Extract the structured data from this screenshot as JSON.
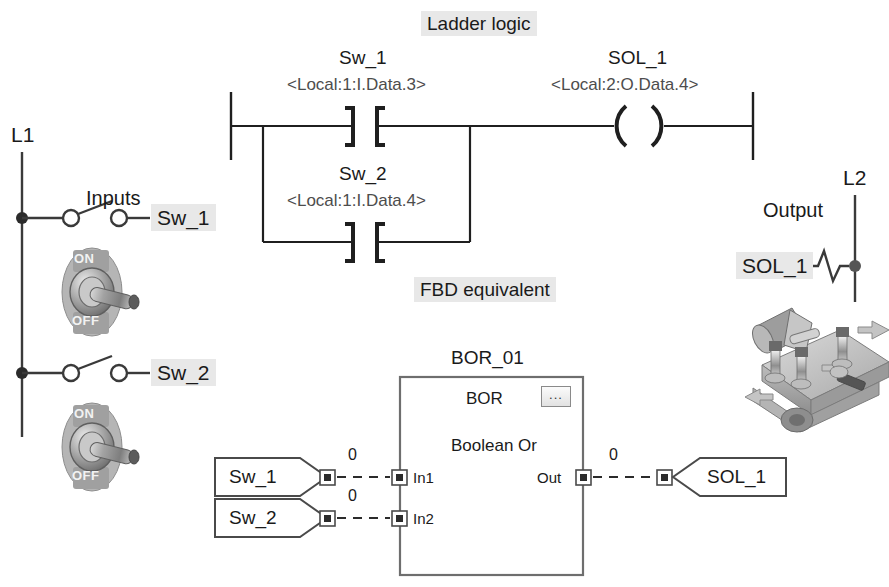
{
  "titles": {
    "ladder": "Ladder logic",
    "fbd": "FBD equivalent"
  },
  "power_rails": {
    "left_label": "L1",
    "right_label": "L2"
  },
  "field_devices": {
    "inputs_label": "Inputs",
    "output_label": "Output",
    "switch_1_label": "Sw_1",
    "switch_2_label": "Sw_2",
    "solenoid_label": "SOL_1",
    "toggle_on_text": "ON",
    "toggle_off_text": "OFF"
  },
  "ladder": {
    "branch1": {
      "name": "Sw_1",
      "address": "<Local:1:I.Data.3>",
      "type": "normally-open-contact"
    },
    "branch2": {
      "name": "Sw_2",
      "address": "<Local:1:I.Data.4>",
      "type": "normally-open-contact"
    },
    "coil": {
      "name": "SOL_1",
      "address": "<Local:2:O.Data.4>",
      "type": "output-coil"
    }
  },
  "fbd": {
    "instance_name": "BOR_01",
    "block_type": "BOR",
    "block_description": "Boolean Or",
    "ellipsis_label": "...",
    "inputs": [
      {
        "tag": "Sw_1",
        "pin": "In1",
        "value": "0"
      },
      {
        "tag": "Sw_2",
        "pin": "In2",
        "value": "0"
      }
    ],
    "output": {
      "tag": "SOL_1",
      "pin": "Out",
      "value": "0"
    }
  },
  "colors": {
    "line": "#3a3a3a",
    "text": "#1a1a1a",
    "addr_text": "#4d4d4d",
    "highlight": "#e8e8e8",
    "block_border": "#6e6e6e"
  }
}
